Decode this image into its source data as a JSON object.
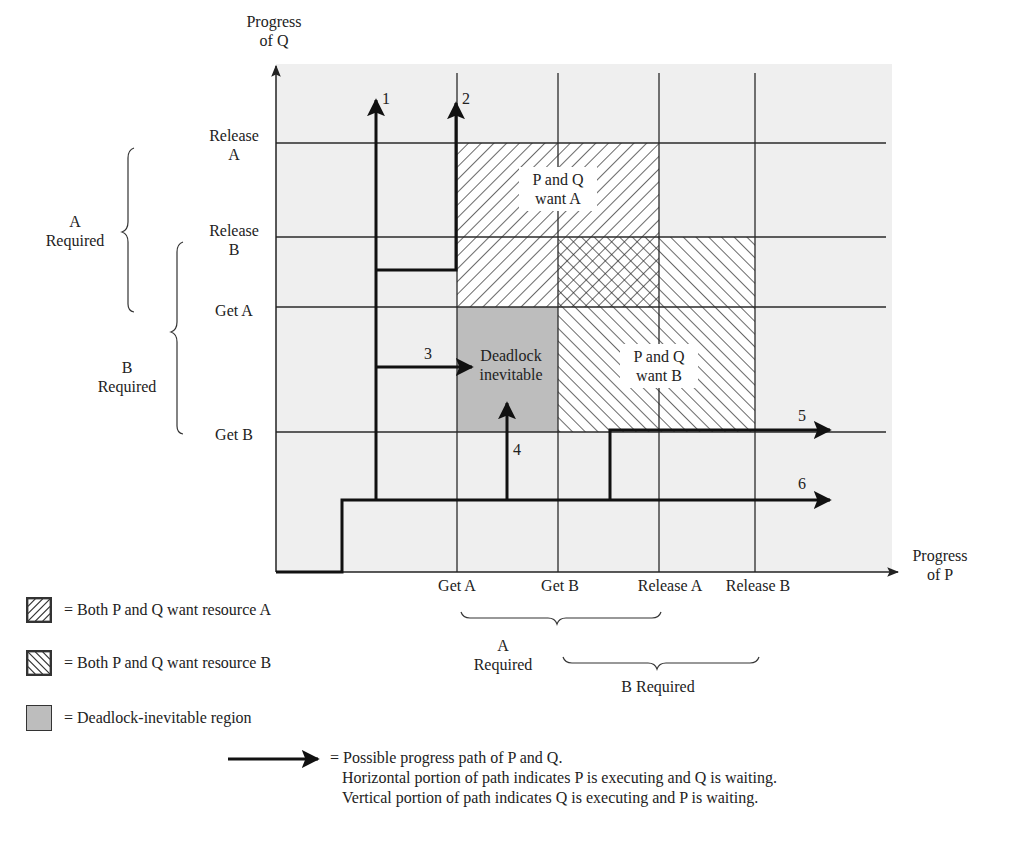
{
  "diagram": {
    "y_axis": {
      "title_line1": "Progress",
      "title_line2": "of Q",
      "ticks": [
        {
          "line1": "Release",
          "line2": "A",
          "y": 143
        },
        {
          "line1": "Release",
          "line2": "B",
          "y": 237
        },
        {
          "line1": "Get A",
          "line2": "",
          "y": 307
        },
        {
          "line1": "Get B",
          "line2": "",
          "y": 432
        }
      ]
    },
    "x_axis": {
      "title_line1": "Progress",
      "title_line2": "of P",
      "ticks": [
        {
          "label": "Get A",
          "x": 457
        },
        {
          "label": "Get B",
          "x": 558
        },
        {
          "label": "Release A",
          "x": 659
        },
        {
          "label": "Release B",
          "x": 755
        }
      ]
    },
    "y_braces": {
      "a_required_line1": "A",
      "a_required_line2": "Required",
      "b_required_line1": "B",
      "b_required_line2": "Required"
    },
    "x_braces": {
      "a_required_line1": "A",
      "a_required_line2": "Required",
      "b_required": "B Required"
    },
    "regions": {
      "want_a_line1": "P and Q",
      "want_a_line2": "want A",
      "want_b_line1": "P and Q",
      "want_b_line2": "want B",
      "deadlock_line1": "Deadlock",
      "deadlock_line2": "inevitable"
    },
    "paths": [
      {
        "id": "1",
        "label": "1"
      },
      {
        "id": "2",
        "label": "2"
      },
      {
        "id": "3",
        "label": "3"
      },
      {
        "id": "4",
        "label": "4"
      },
      {
        "id": "5",
        "label": "5"
      },
      {
        "id": "6",
        "label": "6"
      }
    ],
    "colors": {
      "plot_background": "#efefef",
      "deadlock_fill": "#bdbdbd",
      "line": "#2a2a2a",
      "path": "#111111"
    }
  },
  "legend": {
    "items": [
      {
        "swatch": "hatch-forward",
        "label": "= Both P and Q want resource A"
      },
      {
        "swatch": "hatch-backward",
        "label": "= Both P and Q want resource B"
      },
      {
        "swatch": "solid-gray",
        "label": "= Deadlock-inevitable region"
      }
    ],
    "path_legend": {
      "line1": "= Possible progress path of P and Q.",
      "line2": "Horizontal portion of path indicates P is executing and Q is waiting.",
      "line3": "Vertical portion of path indicates Q is executing and P is waiting."
    }
  }
}
